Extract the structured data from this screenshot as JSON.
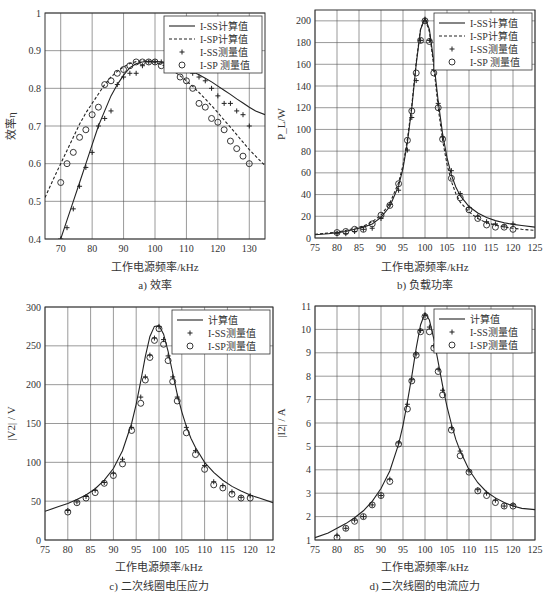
{
  "figure": {
    "bottom_caption": "…传输特性对比结果"
  },
  "chart_data": [
    {
      "id": "a",
      "type": "line",
      "title": "a) 效率",
      "xlabel": "工作电源频率/kHz",
      "ylabel": "效率η",
      "xlim": [
        65,
        135
      ],
      "ylim": [
        0.4,
        1.0
      ],
      "xticks": [
        70,
        80,
        90,
        100,
        110,
        120,
        130
      ],
      "yticks": [
        0.4,
        0.5,
        0.6,
        0.7,
        0.8,
        0.9,
        1
      ],
      "ytick_labels": [
        "0.4",
        "0.5",
        "0.6",
        "0.7",
        "0.8",
        "0.9",
        "1"
      ],
      "grid": true,
      "legend_position": "upper right",
      "series": [
        {
          "name": "I-SS计算值",
          "style": "solid",
          "x": [
            70,
            72,
            74,
            76,
            78,
            80,
            82,
            84,
            86,
            88,
            90,
            92,
            94,
            96,
            98,
            100,
            102,
            104,
            106,
            108,
            110,
            112,
            114,
            116,
            118,
            120,
            122,
            124,
            126,
            128,
            130,
            132,
            135
          ],
          "y": [
            0.4,
            0.45,
            0.5,
            0.55,
            0.6,
            0.65,
            0.7,
            0.74,
            0.78,
            0.81,
            0.835,
            0.855,
            0.865,
            0.87,
            0.872,
            0.872,
            0.87,
            0.867,
            0.862,
            0.857,
            0.851,
            0.844,
            0.836,
            0.827,
            0.817,
            0.806,
            0.795,
            0.784,
            0.772,
            0.761,
            0.75,
            0.74,
            0.73
          ]
        },
        {
          "name": "I-SP计算值",
          "style": "dashed",
          "x": [
            65,
            68,
            70,
            72,
            74,
            76,
            78,
            80,
            82,
            84,
            86,
            88,
            90,
            92,
            94,
            96,
            98,
            100,
            102,
            104,
            106,
            108,
            110,
            112,
            114,
            116,
            118,
            120,
            122,
            124,
            126,
            128,
            130,
            132,
            135
          ],
          "y": [
            0.51,
            0.565,
            0.6,
            0.635,
            0.67,
            0.705,
            0.735,
            0.76,
            0.785,
            0.81,
            0.83,
            0.845,
            0.857,
            0.866,
            0.871,
            0.873,
            0.872,
            0.869,
            0.863,
            0.855,
            0.845,
            0.833,
            0.82,
            0.805,
            0.789,
            0.772,
            0.754,
            0.735,
            0.716,
            0.697,
            0.677,
            0.657,
            0.637,
            0.62,
            0.595
          ]
        },
        {
          "name": "I-SS测量值",
          "style": "plus",
          "x": [
            70,
            72,
            74,
            76,
            78,
            80,
            82,
            84,
            86,
            88,
            90,
            92,
            94,
            96,
            98,
            100,
            102,
            104,
            106,
            108,
            110,
            112,
            114,
            116,
            118,
            120,
            122,
            124,
            126,
            128,
            130
          ],
          "y": [
            0.4,
            0.43,
            0.48,
            0.54,
            0.59,
            0.63,
            0.7,
            0.72,
            0.74,
            0.81,
            0.83,
            0.84,
            0.84,
            0.86,
            0.87,
            0.87,
            0.87,
            0.87,
            0.86,
            0.85,
            0.85,
            0.84,
            0.83,
            0.82,
            0.8,
            0.78,
            0.76,
            0.76,
            0.74,
            0.73,
            0.7
          ]
        },
        {
          "name": "I-SP 测量值",
          "style": "circle",
          "x": [
            70,
            72,
            74,
            76,
            78,
            80,
            82,
            84,
            86,
            88,
            90,
            92,
            94,
            96,
            98,
            100,
            102,
            104,
            106,
            108,
            110,
            112,
            114,
            116,
            118,
            120,
            122,
            124,
            126,
            128,
            130
          ],
          "y": [
            0.55,
            0.6,
            0.63,
            0.67,
            0.69,
            0.73,
            0.75,
            0.81,
            0.82,
            0.84,
            0.85,
            0.86,
            0.87,
            0.87,
            0.87,
            0.87,
            0.86,
            0.86,
            0.85,
            0.83,
            0.82,
            0.8,
            0.76,
            0.75,
            0.72,
            0.71,
            0.69,
            0.66,
            0.64,
            0.62,
            0.6
          ]
        }
      ]
    },
    {
      "id": "b",
      "type": "line",
      "title": "b) 负载功率",
      "xlabel": "工作电源频率/kHz",
      "ylabel": "P_L/W",
      "xlim": [
        75,
        125
      ],
      "ylim": [
        0,
        210
      ],
      "xticks": [
        75,
        80,
        85,
        90,
        95,
        100,
        105,
        110,
        115,
        120,
        125
      ],
      "yticks": [
        0,
        20,
        40,
        60,
        80,
        100,
        120,
        140,
        160,
        180,
        200
      ],
      "grid": true,
      "legend_position": "upper right",
      "series": [
        {
          "name": "I-SS计算值",
          "style": "solid",
          "x": [
            75,
            78,
            80,
            82,
            84,
            86,
            88,
            90,
            92,
            94,
            95,
            96,
            97,
            98,
            99,
            100,
            101,
            102,
            103,
            104,
            105,
            106,
            107,
            108,
            110,
            112,
            114,
            116,
            118,
            120,
            122,
            125
          ],
          "y": [
            3,
            4,
            5,
            6,
            8,
            10,
            13,
            19,
            29,
            48,
            64,
            88,
            120,
            160,
            192,
            203,
            192,
            162,
            126,
            96,
            74,
            58,
            47,
            39,
            29,
            23,
            19,
            16,
            14,
            12.5,
            11.5,
            10
          ]
        },
        {
          "name": "I-SP计算值",
          "style": "dashed",
          "x": [
            75,
            78,
            80,
            82,
            84,
            86,
            88,
            90,
            92,
            94,
            95,
            96,
            97,
            98,
            99,
            100,
            101,
            102,
            103,
            104,
            105,
            106,
            107,
            108,
            110,
            112,
            114,
            116,
            118,
            120,
            122,
            125
          ],
          "y": [
            3.5,
            4.5,
            5.5,
            7,
            9,
            11,
            15,
            21,
            32,
            51,
            67,
            91,
            122,
            162,
            193,
            202,
            190,
            158,
            120,
            90,
            68,
            52,
            41,
            33,
            24,
            18,
            14,
            12,
            10,
            9,
            8,
            7
          ]
        },
        {
          "name": "I-SS测量值",
          "style": "plus",
          "x": [
            80,
            82,
            84,
            86,
            88,
            90,
            92,
            94,
            96,
            97,
            98,
            99,
            100,
            101,
            102,
            103,
            104,
            106,
            108,
            110,
            112,
            114,
            116,
            118,
            120
          ],
          "y": [
            4,
            4,
            6,
            8,
            9,
            18,
            31,
            44,
            81,
            111,
            145,
            182,
            200,
            182,
            155,
            124,
            93,
            62,
            41,
            28,
            20,
            15,
            13,
            11,
            13
          ]
        },
        {
          "name": "I-SP 测量值",
          "style": "circle",
          "x": [
            80,
            82,
            84,
            86,
            88,
            90,
            92,
            94,
            96,
            97,
            98,
            99,
            100,
            101,
            102,
            103,
            104,
            106,
            108,
            110,
            112,
            114,
            116,
            118,
            120
          ],
          "y": [
            5,
            6,
            8,
            8,
            13,
            21,
            30,
            50,
            90,
            117,
            152,
            182,
            200,
            181,
            152,
            120,
            91,
            55,
            37,
            26,
            18,
            12,
            10,
            10,
            8
          ]
        }
      ]
    },
    {
      "id": "c",
      "type": "line",
      "title": "c) 二次线圈电压应力",
      "xlabel": "工作电源频率/kHz",
      "ylabel": "|V2| / V",
      "xlim": [
        75,
        125
      ],
      "ylim": [
        0,
        300
      ],
      "xticks": [
        75,
        80,
        85,
        90,
        95,
        100,
        105,
        110,
        115,
        120,
        125
      ],
      "yticks": [
        0,
        50,
        100,
        150,
        200,
        250,
        300
      ],
      "grid": true,
      "legend_position": "upper right",
      "series": [
        {
          "name": "计算值",
          "style": "solid",
          "x": [
            75,
            78,
            80,
            82,
            84,
            86,
            88,
            90,
            92,
            94,
            95,
            96,
            97,
            98,
            99,
            100,
            101,
            102,
            103,
            104,
            105,
            106,
            107,
            108,
            110,
            112,
            114,
            116,
            118,
            120,
            122,
            125
          ],
          "y": [
            37,
            43,
            47,
            52,
            58,
            66,
            77,
            92,
            115,
            150,
            175,
            205,
            236,
            262,
            275,
            276,
            265,
            243,
            215,
            188,
            165,
            146,
            131,
            119,
            100,
            87,
            77,
            69,
            63,
            58,
            54,
            48
          ]
        },
        {
          "name": "I-SS测量值",
          "style": "plus",
          "x": [
            80,
            82,
            84,
            86,
            88,
            90,
            92,
            94,
            96,
            97,
            98,
            99,
            100,
            101,
            102,
            103,
            104,
            106,
            108,
            110,
            112,
            114,
            116,
            118,
            120
          ],
          "y": [
            38,
            49,
            56,
            64,
            74,
            86,
            104,
            145,
            184,
            210,
            238,
            260,
            275,
            258,
            237,
            210,
            184,
            145,
            115,
            96,
            75,
            70,
            62,
            55,
            57
          ]
        },
        {
          "name": "I-SP测量值",
          "style": "circle",
          "x": [
            80,
            82,
            84,
            86,
            88,
            90,
            92,
            94,
            96,
            97,
            98,
            99,
            100,
            101,
            102,
            103,
            104,
            106,
            108,
            110,
            112,
            114,
            116,
            118,
            120
          ],
          "y": [
            36,
            48,
            54,
            61,
            73,
            83,
            98,
            141,
            176,
            206,
            235,
            257,
            272,
            252,
            231,
            204,
            179,
            138,
            110,
            91,
            71,
            67,
            59,
            54,
            54
          ]
        }
      ]
    },
    {
      "id": "d",
      "type": "line",
      "title": "d) 二次线圈的电流应力",
      "xlabel": "工作电源频率/kHz",
      "ylabel": "|I2| / A",
      "xlim": [
        75,
        125
      ],
      "ylim": [
        1,
        11
      ],
      "xticks": [
        75,
        80,
        85,
        90,
        95,
        100,
        105,
        110,
        115,
        120,
        125
      ],
      "yticks": [
        1,
        2,
        3,
        4,
        5,
        6,
        7,
        8,
        9,
        10,
        11
      ],
      "grid": true,
      "legend_position": "upper right",
      "series": [
        {
          "name": "计算值",
          "style": "solid",
          "x": [
            75,
            78,
            80,
            82,
            84,
            86,
            88,
            90,
            92,
            94,
            95,
            96,
            97,
            98,
            99,
            100,
            101,
            102,
            103,
            104,
            105,
            106,
            107,
            108,
            110,
            112,
            114,
            116,
            118,
            120,
            122,
            125
          ],
          "y": [
            1.1,
            1.3,
            1.5,
            1.7,
            1.95,
            2.25,
            2.65,
            3.2,
            3.95,
            5.1,
            5.9,
            6.9,
            8.0,
            9.2,
            10.2,
            10.7,
            10.4,
            9.6,
            8.6,
            7.6,
            6.7,
            5.95,
            5.3,
            4.8,
            4.0,
            3.45,
            3.05,
            2.8,
            2.6,
            2.45,
            2.35,
            2.3
          ]
        },
        {
          "name": "I-SS测量值",
          "style": "plus",
          "x": [
            80,
            82,
            84,
            86,
            88,
            90,
            92,
            94,
            96,
            97,
            98,
            99,
            100,
            101,
            102,
            103,
            104,
            106,
            108,
            110,
            112,
            114,
            116,
            118,
            120
          ],
          "y": [
            1.2,
            1.5,
            1.85,
            2.0,
            2.5,
            2.9,
            3.6,
            5.15,
            6.8,
            7.85,
            8.95,
            9.95,
            10.6,
            10.1,
            9.3,
            8.3,
            7.4,
            5.8,
            4.8,
            3.95,
            3.15,
            3.0,
            2.7,
            2.45,
            2.5
          ]
        },
        {
          "name": "I-SP测量值",
          "style": "circle",
          "x": [
            80,
            82,
            84,
            86,
            88,
            90,
            92,
            94,
            96,
            97,
            98,
            99,
            100,
            101,
            102,
            103,
            104,
            106,
            108,
            110,
            112,
            114,
            116,
            118,
            120
          ],
          "y": [
            1.1,
            1.5,
            1.8,
            2.0,
            2.5,
            2.9,
            3.5,
            5.1,
            6.6,
            7.8,
            8.9,
            9.9,
            10.55,
            9.9,
            9.2,
            8.2,
            7.2,
            5.7,
            4.6,
            3.9,
            3.1,
            2.9,
            2.6,
            2.45,
            2.45
          ]
        }
      ]
    }
  ]
}
